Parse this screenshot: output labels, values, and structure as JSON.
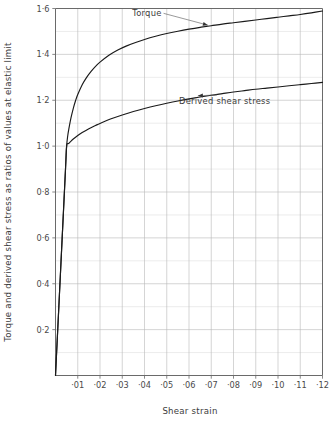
{
  "chart_data": {
    "type": "line",
    "title": "",
    "xlabel": "Shear strain",
    "ylabel": "Torque and derived shear stress as ratios of values at elastic limit",
    "xlim": [
      0,
      0.12
    ],
    "ylim": [
      0,
      1.6
    ],
    "grid": true,
    "legend": "inline annotations",
    "x_ticks": [
      0.01,
      0.02,
      0.03,
      0.04,
      0.05,
      0.06,
      0.07,
      0.08,
      0.09,
      0.1,
      0.11,
      0.12
    ],
    "x_tick_labels": [
      "·01",
      "·02",
      "·03",
      "·04",
      "·05",
      "·06",
      "·07",
      "·08",
      "·09",
      "·10",
      "·11",
      "·12"
    ],
    "y_ticks": [
      0.2,
      0.4,
      0.6,
      0.8,
      1.0,
      1.2,
      1.4,
      1.6
    ],
    "y_tick_labels": [
      "0·2",
      "0·4",
      "0·6",
      "0·8",
      "1·0",
      "1·2",
      "1·4",
      "1·6"
    ],
    "y_minor_step": 0.1,
    "series": [
      {
        "name": "Torque",
        "color": "#1a1a1a",
        "x": [
          0,
          0.0005,
          0.0015,
          0.003,
          0.0045,
          0.005,
          0.0055,
          0.006,
          0.007,
          0.008,
          0.009,
          0.01,
          0.012,
          0.014,
          0.016,
          0.018,
          0.02,
          0.024,
          0.028,
          0.032,
          0.036,
          0.04,
          0.045,
          0.05,
          0.055,
          0.06,
          0.065,
          0.07,
          0.075,
          0.08,
          0.085,
          0.09,
          0.095,
          0.1,
          0.105,
          0.11,
          0.115,
          0.12
        ],
        "y": [
          0,
          0.1,
          0.3,
          0.6,
          0.9,
          1.0,
          1.045,
          1.075,
          1.125,
          1.165,
          1.198,
          1.225,
          1.268,
          1.3,
          1.326,
          1.348,
          1.366,
          1.396,
          1.419,
          1.437,
          1.452,
          1.465,
          1.479,
          1.491,
          1.501,
          1.51,
          1.518,
          1.525,
          1.532,
          1.538,
          1.544,
          1.55,
          1.556,
          1.562,
          1.568,
          1.574,
          1.581,
          1.589
        ]
      },
      {
        "name": "Derived shear stress",
        "color": "#1a1a1a",
        "x": [
          0,
          0.0005,
          0.0015,
          0.003,
          0.0045,
          0.005,
          0.006,
          0.007,
          0.008,
          0.01,
          0.012,
          0.015,
          0.018,
          0.02,
          0.025,
          0.03,
          0.035,
          0.04,
          0.045,
          0.05,
          0.055,
          0.06,
          0.065,
          0.07,
          0.075,
          0.08,
          0.085,
          0.09,
          0.095,
          0.1,
          0.105,
          0.11,
          0.115,
          0.12
        ],
        "y": [
          0,
          0.1,
          0.3,
          0.6,
          0.9,
          1.0,
          1.012,
          1.022,
          1.031,
          1.046,
          1.059,
          1.076,
          1.09,
          1.099,
          1.119,
          1.136,
          1.151,
          1.164,
          1.176,
          1.187,
          1.197,
          1.206,
          1.214,
          1.222,
          1.229,
          1.236,
          1.242,
          1.248,
          1.253,
          1.258,
          1.263,
          1.268,
          1.273,
          1.278
        ]
      }
    ],
    "annotations": [
      {
        "name": "torque-annotation",
        "text": "Torque",
        "label_x": 0.0345,
        "label_y": 1.568,
        "target_x": 0.0685,
        "target_y": 1.523
      },
      {
        "name": "derived-shear-stress-annotation",
        "text": "Derived shear stress",
        "label_x": 0.0555,
        "label_y": 1.182,
        "target_x": 0.064,
        "target_y": 1.228
      }
    ]
  }
}
